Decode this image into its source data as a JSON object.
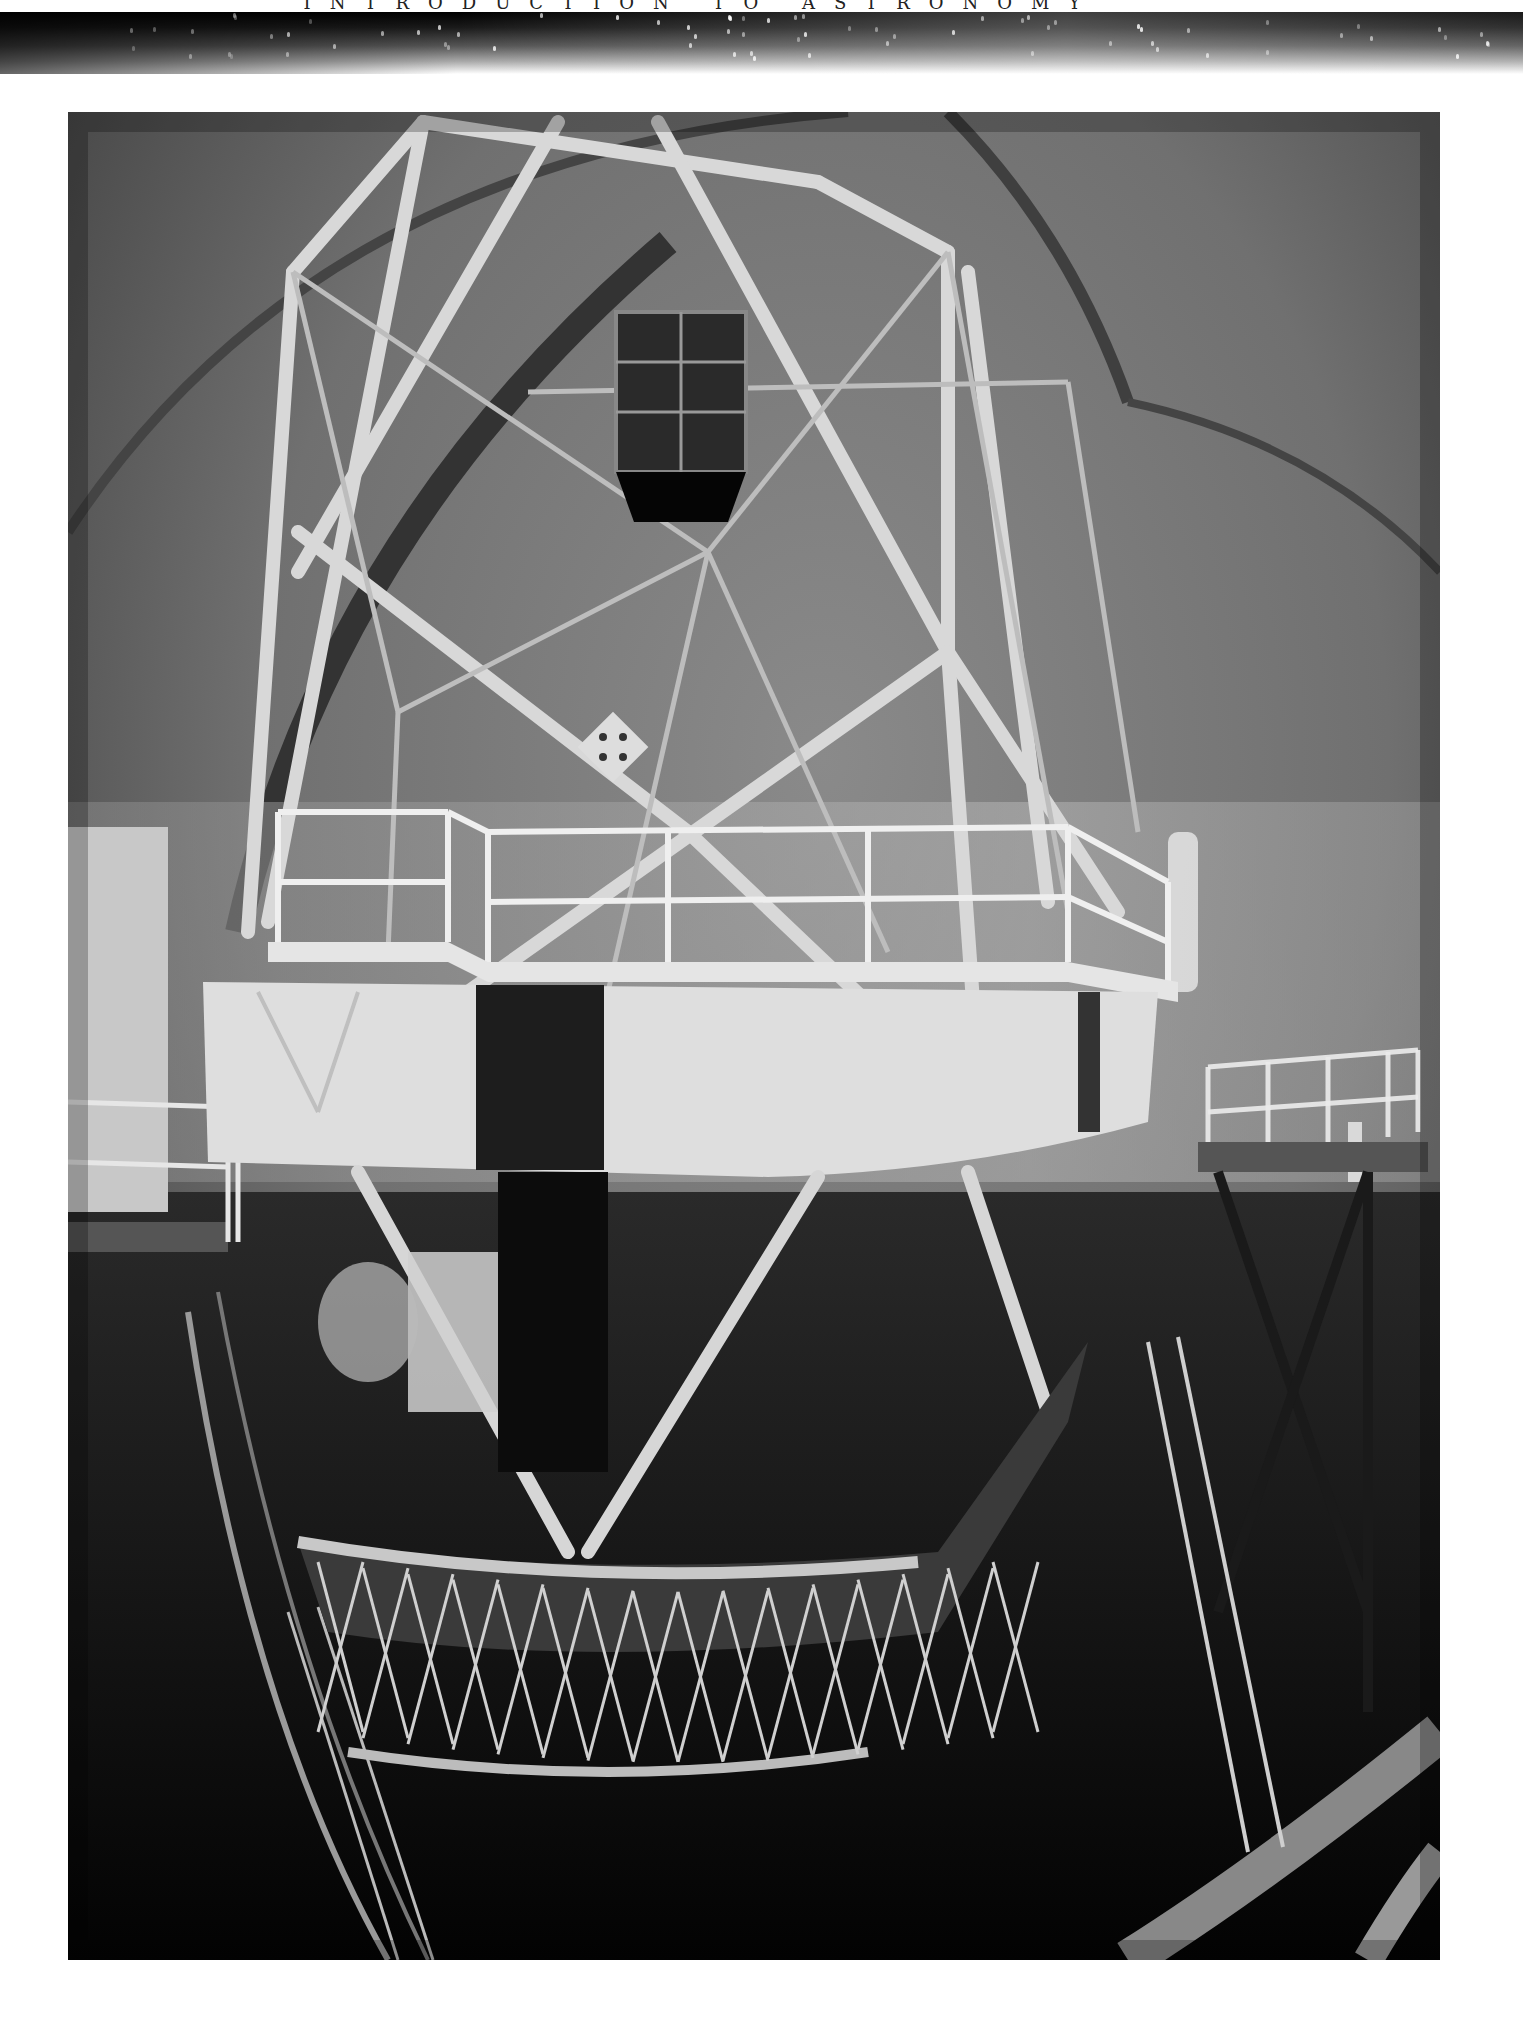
{
  "page": {
    "running_head": "INTRODUCTION TO ASTRONOMY"
  },
  "figure": {
    "tone": "grayscale"
  },
  "colors": {
    "page_background": "#ffffff",
    "header_band_dark": "#000000",
    "photo_mid_gray": "#6a6a6a"
  }
}
